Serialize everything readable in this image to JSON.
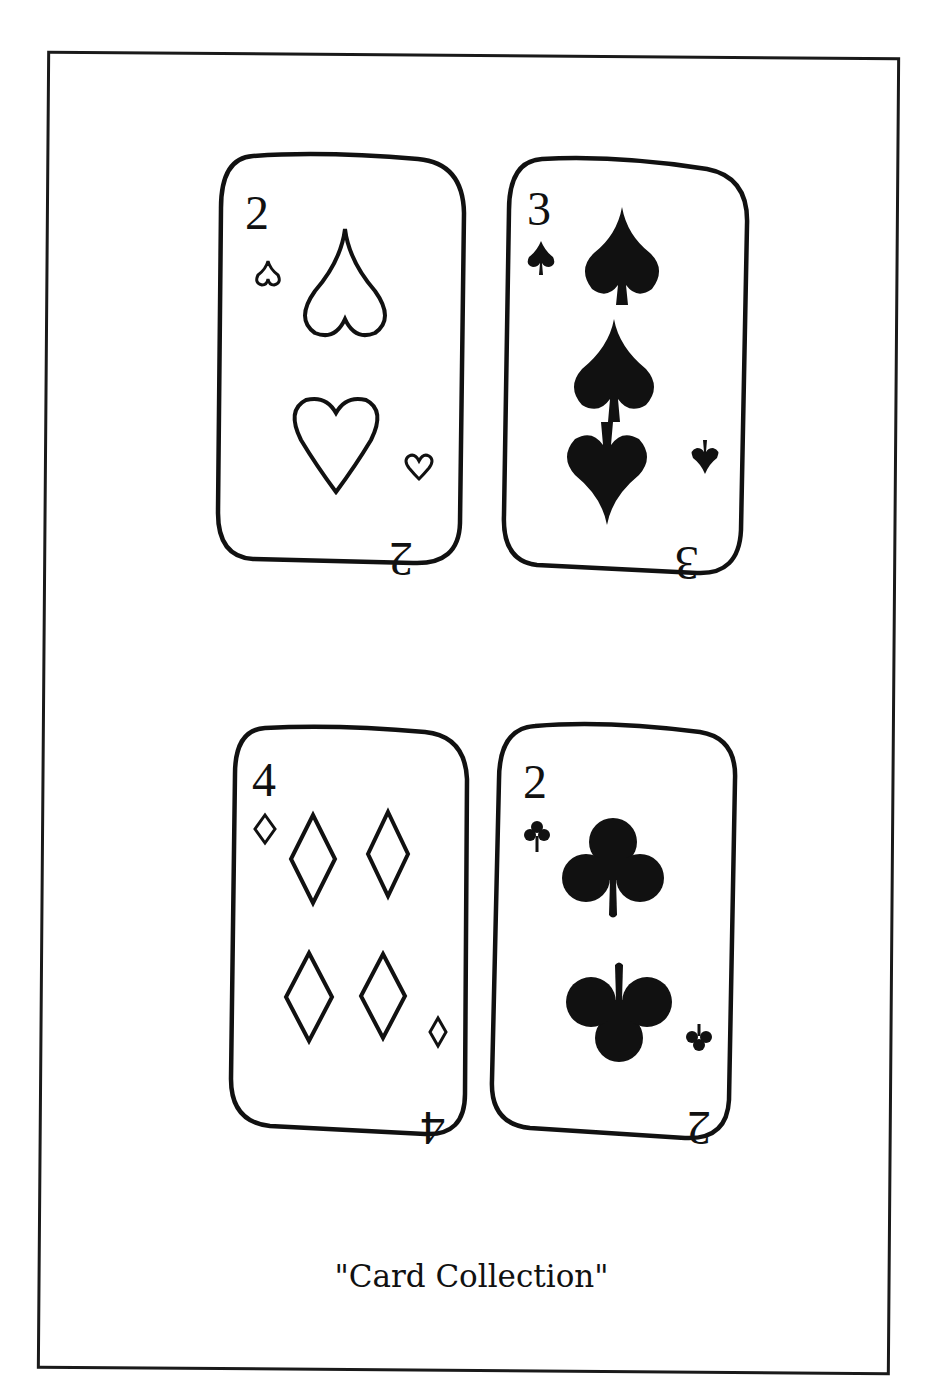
{
  "caption": "\"Card Collection\"",
  "colors": {
    "ink": "#111111",
    "paper": "#ffffff"
  },
  "cards": [
    {
      "rank": "2",
      "suit": "hearts",
      "suit_icon": "heart-outline",
      "pips": 2,
      "filled": false
    },
    {
      "rank": "3",
      "suit": "spades",
      "suit_icon": "spade-filled",
      "pips": 3,
      "filled": true
    },
    {
      "rank": "4",
      "suit": "diamonds",
      "suit_icon": "diamond-outline",
      "pips": 4,
      "filled": false
    },
    {
      "rank": "2",
      "suit": "clubs",
      "suit_icon": "club-filled",
      "pips": 2,
      "filled": true
    }
  ]
}
